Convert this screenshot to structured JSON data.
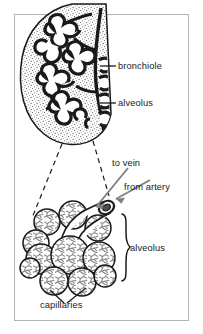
{
  "figure": {
    "frame": {
      "border_color": "#b4b4b4",
      "background": "#ffffff"
    },
    "colors": {
      "ink": "#1a1a1a",
      "arrow_gray": "#808080",
      "capillary_gray": "#8c8c8c",
      "stipple": "#555555",
      "frame": "#b4b4b4"
    },
    "labels": {
      "bronchiole": "bronchiole",
      "alveolus_top": "alveolus",
      "to_vein": "to vein",
      "from_artery": "from artery",
      "alveolus_bottom": "alveolus",
      "capillaries": "capillaries"
    },
    "parts": {
      "lobule": "lung-lobule-stippled",
      "bronchial_tree": "branching-bronchiole-tree",
      "alveolar_sac": "alveolar-sac-cluster",
      "magnification_cone": "dashed-magnification-lines",
      "brace": "curly-brace",
      "vein_arrow": "to-vein-arrow",
      "artery_arrow": "from-artery-arrow",
      "capillary_leaders": "capillaries-leader-lines"
    }
  }
}
